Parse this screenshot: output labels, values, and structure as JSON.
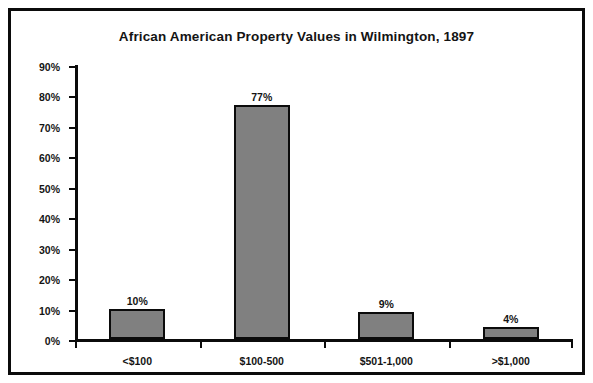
{
  "figure": {
    "frame_color": "#0b0b0b",
    "background": "#ffffff"
  },
  "chart_data": {
    "type": "bar",
    "title": "African American Property Values in Wilmington, 1897",
    "subtitle": "",
    "xlabel": "",
    "ylabel": "",
    "categories": [
      "<$100",
      "$100-500",
      "$501-1,000",
      ">$1,000"
    ],
    "values": [
      10,
      77,
      9,
      4
    ],
    "value_labels": [
      "10%",
      "77%",
      "9%",
      "4%"
    ],
    "ylim": [
      0,
      90
    ],
    "ytick_values": [
      0,
      10,
      20,
      30,
      40,
      50,
      60,
      70,
      80,
      90
    ],
    "ytick_labels": [
      "0%",
      "10%",
      "20%",
      "30%",
      "40%",
      "50%",
      "60%",
      "70%",
      "80%",
      "90%"
    ],
    "grid": false,
    "legend": null,
    "bar_fill_color": "#808080",
    "bar_edge_color": "#0b0b0b",
    "axis_color": "#0b0b0b",
    "text_color": "#141414"
  }
}
